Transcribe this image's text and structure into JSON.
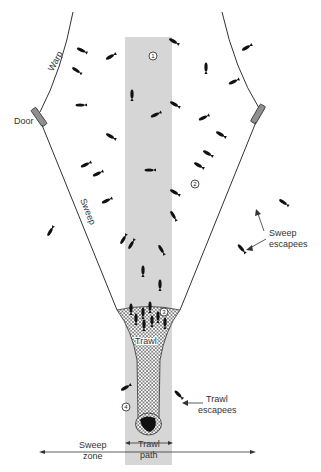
{
  "colors": {
    "background": "#ffffff",
    "trawl_path_band": "#d6d6d6",
    "lines": "#333333",
    "door": "#8f8f8f",
    "fish": "#111111",
    "text": "#333333"
  },
  "labels": {
    "warp": "Warp",
    "door": "Door",
    "sweep": "Sweep",
    "sweep_escapees_line1": "Sweep",
    "sweep_escapees_line2": "escapees",
    "trawl": "Trawl",
    "trawl_escapees_line1": "Trawl",
    "trawl_escapees_line2": "escapees",
    "trawl_path_line1": "Trawl",
    "trawl_path_line2": "path",
    "sweep_zone_line1": "Sweep",
    "sweep_zone_line2": "zone"
  },
  "zone_markers": [
    {
      "id": "1",
      "label": "1",
      "x": 153,
      "y": 56
    },
    {
      "id": "2",
      "label": "2",
      "x": 195,
      "y": 184
    },
    {
      "id": "3",
      "label": "3",
      "x": 164,
      "y": 312
    },
    {
      "id": "4",
      "label": "4",
      "x": 126,
      "y": 407
    }
  ],
  "fish": [
    {
      "x": 81,
      "y": 50,
      "angle": 25
    },
    {
      "x": 110,
      "y": 57,
      "angle": -30
    },
    {
      "x": 76,
      "y": 70,
      "angle": 35
    },
    {
      "x": 132,
      "y": 94,
      "angle": 90
    },
    {
      "x": 80,
      "y": 105,
      "angle": 0
    },
    {
      "x": 110,
      "y": 136,
      "angle": 30
    },
    {
      "x": 173,
      "y": 41,
      "angle": 30
    },
    {
      "x": 206,
      "y": 67,
      "angle": 90
    },
    {
      "x": 246,
      "y": 48,
      "angle": -30
    },
    {
      "x": 233,
      "y": 82,
      "angle": -25
    },
    {
      "x": 155,
      "y": 115,
      "angle": -25
    },
    {
      "x": 174,
      "y": 104,
      "angle": 30
    },
    {
      "x": 203,
      "y": 118,
      "angle": -25
    },
    {
      "x": 220,
      "y": 134,
      "angle": 30
    },
    {
      "x": 207,
      "y": 153,
      "angle": 30
    },
    {
      "x": 198,
      "y": 165,
      "angle": 30
    },
    {
      "x": 85,
      "y": 165,
      "angle": -25
    },
    {
      "x": 97,
      "y": 174,
      "angle": -25
    },
    {
      "x": 106,
      "y": 201,
      "angle": -25
    },
    {
      "x": 149,
      "y": 170,
      "angle": 0
    },
    {
      "x": 174,
      "y": 192,
      "angle": 30
    },
    {
      "x": 173,
      "y": 215,
      "angle": 60
    },
    {
      "x": 50,
      "y": 232,
      "angle": -60
    },
    {
      "x": 123,
      "y": 240,
      "angle": -60
    },
    {
      "x": 131,
      "y": 245,
      "angle": -60
    },
    {
      "x": 161,
      "y": 249,
      "angle": 60
    },
    {
      "x": 283,
      "y": 202,
      "angle": 35
    },
    {
      "x": 241,
      "y": 248,
      "angle": 50
    },
    {
      "x": 143,
      "y": 270,
      "angle": 90
    },
    {
      "x": 160,
      "y": 284,
      "angle": 90
    },
    {
      "x": 131,
      "y": 308,
      "angle": 90
    },
    {
      "x": 136,
      "y": 318,
      "angle": 90
    },
    {
      "x": 143,
      "y": 312,
      "angle": 90
    },
    {
      "x": 150,
      "y": 306,
      "angle": 90
    },
    {
      "x": 152,
      "y": 320,
      "angle": 90
    },
    {
      "x": 158,
      "y": 316,
      "angle": 90
    },
    {
      "x": 165,
      "y": 322,
      "angle": 90
    },
    {
      "x": 144,
      "y": 324,
      "angle": 90
    },
    {
      "x": 125,
      "y": 388,
      "angle": -30
    },
    {
      "x": 178,
      "y": 394,
      "angle": 45
    }
  ]
}
